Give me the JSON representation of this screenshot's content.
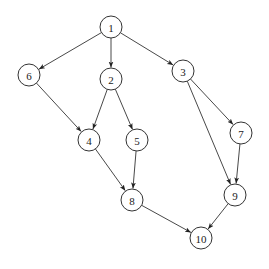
{
  "diagram": {
    "type": "directed-graph",
    "node_radius": 11,
    "stroke_color": "#333333",
    "background": "#ffffff",
    "nodes": [
      {
        "id": "1",
        "label": "1",
        "x": 111,
        "y": 27
      },
      {
        "id": "2",
        "label": "2",
        "x": 111,
        "y": 79
      },
      {
        "id": "3",
        "label": "3",
        "x": 183,
        "y": 71
      },
      {
        "id": "4",
        "label": "4",
        "x": 89,
        "y": 140
      },
      {
        "id": "5",
        "label": "5",
        "x": 137,
        "y": 140
      },
      {
        "id": "6",
        "label": "6",
        "x": 29,
        "y": 75
      },
      {
        "id": "7",
        "label": "7",
        "x": 241,
        "y": 133
      },
      {
        "id": "8",
        "label": "8",
        "x": 132,
        "y": 200
      },
      {
        "id": "9",
        "label": "9",
        "x": 235,
        "y": 195
      },
      {
        "id": "10",
        "label": "10",
        "x": 201,
        "y": 238
      }
    ],
    "edges": [
      {
        "from": "1",
        "to": "6"
      },
      {
        "from": "1",
        "to": "2"
      },
      {
        "from": "1",
        "to": "3"
      },
      {
        "from": "6",
        "to": "4"
      },
      {
        "from": "2",
        "to": "4"
      },
      {
        "from": "2",
        "to": "5"
      },
      {
        "from": "3",
        "to": "7"
      },
      {
        "from": "3",
        "to": "9"
      },
      {
        "from": "4",
        "to": "8"
      },
      {
        "from": "5",
        "to": "8"
      },
      {
        "from": "7",
        "to": "9"
      },
      {
        "from": "8",
        "to": "10"
      },
      {
        "from": "9",
        "to": "10"
      }
    ]
  }
}
